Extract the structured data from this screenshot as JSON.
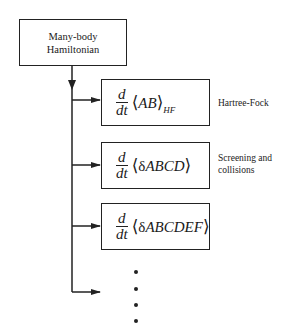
{
  "diagram": {
    "root": {
      "line1": "Many-body",
      "line2": "Hamiltonian"
    },
    "nodes": [
      {
        "numerator": "d",
        "denominator": "dt",
        "open": "⟨",
        "body": "AB",
        "close": "⟩",
        "subscript": "HF",
        "label_lines": [
          "Hartree-Fock"
        ]
      },
      {
        "numerator": "d",
        "denominator": "dt",
        "open": "⟨",
        "delta": "δ",
        "body": "ABCD",
        "close": "⟩",
        "subscript": "",
        "label_lines": [
          "Screening and",
          "collisions"
        ]
      },
      {
        "numerator": "d",
        "denominator": "dt",
        "open": "⟨",
        "delta": "δ",
        "body": "ABCDEF",
        "close": "⟩",
        "subscript": "",
        "label_lines": []
      }
    ],
    "continuation": "ellipsis (vertical dots)"
  }
}
